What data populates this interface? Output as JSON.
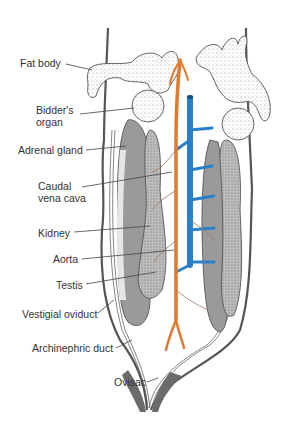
{
  "figure": {
    "colors": {
      "aorta": "#e07a2e",
      "vena_cava": "#2a7fc9",
      "kidney": "#9a9a9a",
      "testis": "#c8c8c8",
      "outline": "#555555",
      "label_text": "#333333",
      "leader_line": "#444444"
    },
    "labels": [
      {
        "id": "fat-body",
        "line1": "Fat body",
        "line2": ""
      },
      {
        "id": "bidders-organ",
        "line1": "Bidder's",
        "line2": "organ"
      },
      {
        "id": "adrenal-gland",
        "line1": "Adrenal gland",
        "line2": ""
      },
      {
        "id": "caudal-vena-cava",
        "line1": "Caudal",
        "line2": "vena cava"
      },
      {
        "id": "kidney",
        "line1": "Kidney",
        "line2": ""
      },
      {
        "id": "aorta",
        "line1": "Aorta",
        "line2": ""
      },
      {
        "id": "testis",
        "line1": "Testis",
        "line2": ""
      },
      {
        "id": "vestigial-oviduct",
        "line1": "Vestigial oviduct",
        "line2": ""
      },
      {
        "id": "archinephric-duct",
        "line1": "Archinephric duct",
        "line2": ""
      },
      {
        "id": "ovisac",
        "line1": "Ovisac",
        "line2": ""
      }
    ]
  }
}
